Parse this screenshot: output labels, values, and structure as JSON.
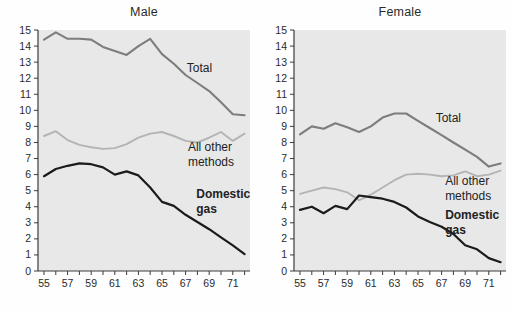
{
  "figure_title": "",
  "colors": {
    "plot_background": "#e8e8e8",
    "axis": "#3a3a3a",
    "tick_text": "#2a2a2a",
    "total_line": "#7d7d7d",
    "other_line": "#b4b4b4",
    "gas_line": "#1b1b1b",
    "annotation_text": "#222222"
  },
  "chart_data": [
    {
      "type": "line",
      "title": "Male",
      "xlabel": "",
      "ylabel": "",
      "x": [
        55,
        56,
        57,
        58,
        59,
        60,
        61,
        62,
        63,
        64,
        65,
        66,
        67,
        68,
        69,
        70,
        71,
        72
      ],
      "xtick_labels": [
        "55",
        "57",
        "59",
        "61",
        "63",
        "65",
        "67",
        "69",
        "71"
      ],
      "xtick_years": [
        55,
        57,
        59,
        61,
        63,
        65,
        67,
        69,
        71
      ],
      "ylim": [
        0,
        15
      ],
      "ytick_step": 1,
      "grid": false,
      "legend_position": "inline-annotations",
      "series": [
        {
          "name": "All other methods",
          "color": "#b4b4b4",
          "stroke_width": 1.9,
          "values": [
            8.4,
            8.7,
            8.15,
            7.85,
            7.7,
            7.6,
            7.65,
            7.9,
            8.3,
            8.55,
            8.65,
            8.4,
            8.1,
            8.0,
            8.3,
            8.65,
            8.1,
            8.55
          ]
        },
        {
          "name": "Total",
          "color": "#7d7d7d",
          "stroke_width": 2.1,
          "values": [
            14.4,
            14.85,
            14.45,
            14.45,
            14.4,
            13.95,
            13.7,
            13.45,
            14.0,
            14.45,
            13.5,
            12.9,
            12.2,
            11.7,
            11.2,
            10.5,
            9.75,
            9.7
          ]
        },
        {
          "name": "Domestic gas",
          "color": "#1b1b1b",
          "stroke_width": 2.2,
          "values": [
            5.9,
            6.35,
            6.55,
            6.7,
            6.65,
            6.45,
            6.0,
            6.2,
            5.95,
            5.2,
            4.3,
            4.05,
            3.5,
            3.05,
            2.6,
            2.1,
            1.6,
            1.05
          ]
        }
      ],
      "annotations": [
        {
          "lines": [
            "Total"
          ],
          "x": 67.1,
          "y": 12.4,
          "bold": false
        },
        {
          "lines": [
            "All other",
            "methods"
          ],
          "x": 67.2,
          "y": 7.5,
          "bold": false
        },
        {
          "lines": [
            "Domestic",
            "gas"
          ],
          "x": 67.9,
          "y": 4.55,
          "bold": true
        }
      ]
    },
    {
      "type": "line",
      "title": "Female",
      "xlabel": "",
      "ylabel": "",
      "x": [
        55,
        56,
        57,
        58,
        59,
        60,
        61,
        62,
        63,
        64,
        65,
        66,
        67,
        68,
        69,
        70,
        71,
        72
      ],
      "xtick_labels": [
        "55",
        "57",
        "59",
        "61",
        "63",
        "65",
        "67",
        "69",
        "71"
      ],
      "xtick_years": [
        55,
        57,
        59,
        61,
        63,
        65,
        67,
        69,
        71
      ],
      "ylim": [
        0,
        15
      ],
      "ytick_step": 1,
      "grid": false,
      "legend_position": "inline-annotations",
      "series": [
        {
          "name": "All other methods",
          "color": "#b4b4b4",
          "stroke_width": 1.9,
          "values": [
            4.8,
            5.0,
            5.2,
            5.1,
            4.9,
            4.4,
            4.75,
            5.2,
            5.65,
            6.0,
            6.05,
            6.0,
            5.9,
            5.95,
            6.2,
            5.9,
            6.0,
            6.25
          ]
        },
        {
          "name": "Total",
          "color": "#7d7d7d",
          "stroke_width": 2.1,
          "values": [
            8.5,
            9.0,
            8.85,
            9.2,
            8.95,
            8.65,
            9.0,
            9.55,
            9.8,
            9.8,
            9.35,
            8.9,
            8.45,
            8.0,
            7.55,
            7.1,
            6.5,
            6.7
          ]
        },
        {
          "name": "Domestic gas",
          "color": "#1b1b1b",
          "stroke_width": 2.2,
          "values": [
            3.8,
            4.0,
            3.6,
            4.05,
            3.85,
            4.7,
            4.6,
            4.5,
            4.3,
            3.95,
            3.4,
            3.05,
            2.75,
            2.3,
            1.6,
            1.35,
            0.8,
            0.55
          ]
        }
      ],
      "annotations": [
        {
          "lines": [
            "Total"
          ],
          "x": 66.5,
          "y": 9.25,
          "bold": false
        },
        {
          "lines": [
            "All other",
            "methods"
          ],
          "x": 67.3,
          "y": 5.35,
          "bold": false
        },
        {
          "lines": [
            "Domestic",
            "gas"
          ],
          "x": 67.3,
          "y": 3.25,
          "bold": true
        }
      ]
    }
  ]
}
